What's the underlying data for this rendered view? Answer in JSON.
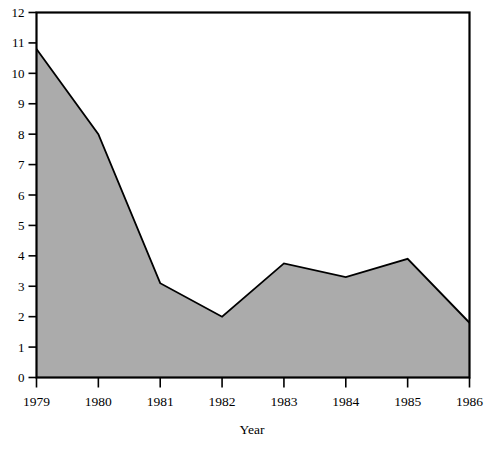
{
  "chart_data": {
    "type": "area",
    "title": "",
    "subtitle": "",
    "xlabel": "Year",
    "ylabel": "",
    "categories": [
      "1979",
      "1980",
      "1981",
      "1982",
      "1983",
      "1984",
      "1985",
      "1986"
    ],
    "x": [
      1979,
      1980,
      1981,
      1982,
      1983,
      1984,
      1985,
      1986
    ],
    "values": [
      10.8,
      8.0,
      3.1,
      2.0,
      3.75,
      3.3,
      3.9,
      1.8
    ],
    "series": [
      {
        "name": "",
        "values": [
          10.8,
          8.0,
          3.1,
          2.0,
          3.75,
          3.3,
          3.9,
          1.8
        ]
      }
    ],
    "xlim": [
      1979,
      1986
    ],
    "ylim": [
      0,
      12
    ],
    "ytick_labels": [
      "0",
      "1",
      "2",
      "3",
      "4",
      "5",
      "6",
      "7",
      "8",
      "9",
      "10",
      "11",
      "12"
    ],
    "ytick_values": [
      0,
      1,
      2,
      3,
      4,
      5,
      6,
      7,
      8,
      9,
      10,
      11,
      12
    ],
    "xtick_labels": [
      "1979",
      "1980",
      "1981",
      "1982",
      "1983",
      "1984",
      "1985",
      "1986"
    ],
    "grid": false,
    "legend": false,
    "legend_position": "none",
    "annotations": [],
    "colors": {
      "area_fill": "#ababab",
      "line": "#000000",
      "axis": "#000000",
      "background": "#ffffff",
      "text": "#000000"
    }
  }
}
